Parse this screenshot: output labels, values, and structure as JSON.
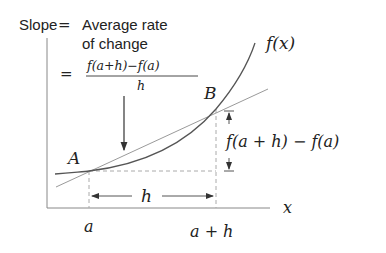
{
  "diagram": {
    "title_line1": "Slope = Average rate",
    "title_slope": "Slope",
    "title_eq": "=",
    "title_avg": "Average rate",
    "title_line2": "of change",
    "formula_eq": "=",
    "formula_numerator": "f(a+h)−f(a)",
    "formula_denominator": "h",
    "curve_label": "f(x)",
    "point_a_label": "A",
    "point_b_label": "B",
    "rise_label": "f(a + h) − f(a)",
    "run_label": "h",
    "x_axis_label": "x",
    "tick_a_label": "a",
    "tick_a_plus_h_label": "a + h"
  },
  "colors": {
    "curve": "#555555",
    "secant": "#9a9a9a",
    "axis": "#888888",
    "dashed": "#aaaaaa",
    "text": "#222222"
  }
}
